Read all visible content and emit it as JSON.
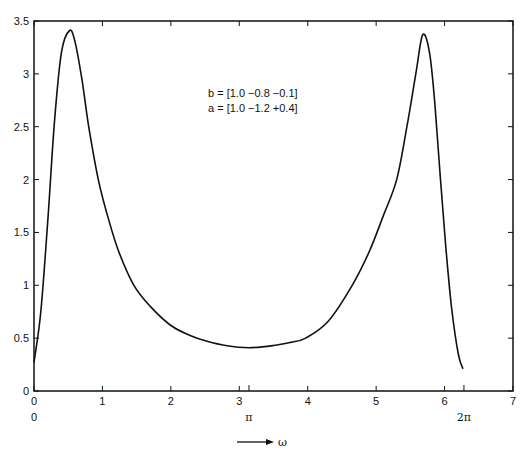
{
  "chart_data": {
    "type": "line",
    "title": "",
    "xlabel": "ω",
    "ylabel": "",
    "xlim": [
      0,
      7
    ],
    "ylim": [
      0,
      3.5
    ],
    "grid": false,
    "legend": null,
    "x_ticks": [
      0,
      1,
      2,
      3,
      4,
      5,
      6,
      7
    ],
    "x_tick_labels": [
      "0",
      "1",
      "2",
      "3",
      "4",
      "5",
      "6",
      "7"
    ],
    "y_ticks": [
      0,
      0.5,
      1,
      1.5,
      2,
      2.5,
      3,
      3.5
    ],
    "y_tick_labels": [
      "0",
      "0.5",
      "1",
      "1.5",
      "2",
      "2.5",
      "3",
      "3.5"
    ],
    "secondary_x_labels": [
      {
        "value": 0,
        "label": "0"
      },
      {
        "value": 3.1416,
        "label": "π"
      },
      {
        "value": 6.2832,
        "label": "2π"
      }
    ],
    "annotations": [
      "b = [1.0  −0.8  −0.1]",
      "a = [1.0  −1.2  +0.4]"
    ],
    "axis_arrow_label": "ω",
    "series": [
      {
        "name": "|H(e^jω)|",
        "x": [
          0.0,
          0.1,
          0.2,
          0.3,
          0.4,
          0.52,
          0.6,
          0.7,
          0.8,
          0.94,
          1.1,
          1.25,
          1.46,
          1.7,
          2.0,
          2.3,
          2.53,
          2.8,
          3.1416,
          3.5,
          3.75,
          3.97,
          4.3,
          4.65,
          4.9,
          5.1,
          5.3,
          5.45,
          5.58,
          5.68,
          5.78,
          5.86,
          5.94,
          6.02,
          6.1,
          6.2,
          6.27
        ],
        "y": [
          0.27,
          0.75,
          1.6,
          2.55,
          3.2,
          3.41,
          3.3,
          2.95,
          2.5,
          2.0,
          1.6,
          1.3,
          1.0,
          0.8,
          0.62,
          0.52,
          0.47,
          0.43,
          0.41,
          0.43,
          0.46,
          0.5,
          0.66,
          1.0,
          1.32,
          1.65,
          2.0,
          2.5,
          3.0,
          3.37,
          3.2,
          2.7,
          2.0,
          1.35,
          0.8,
          0.35,
          0.21
        ]
      }
    ]
  }
}
